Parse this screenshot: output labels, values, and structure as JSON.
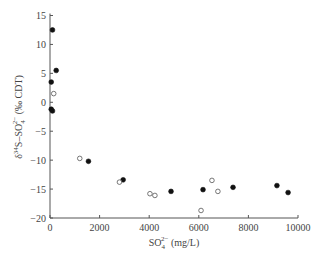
{
  "chart_data": {
    "type": "scatter",
    "title": "",
    "xlabel": "SO4^2- (mg/L)",
    "ylabel": "δ34S–SO4^2- (‰ CDT)",
    "xlim": [
      0,
      10000
    ],
    "ylim": [
      -20,
      15
    ],
    "xticks": [
      0,
      2000,
      4000,
      6000,
      8000,
      10000
    ],
    "yticks": [
      -20,
      -15,
      -10,
      -5,
      0,
      5,
      10,
      15
    ],
    "grid": false,
    "legend": null,
    "series": [
      {
        "name": "filled",
        "marker": "filled-circle",
        "color": "#111111",
        "points": [
          [
            100,
            12.5
          ],
          [
            250,
            5.5
          ],
          [
            50,
            3.5
          ],
          [
            50,
            -1.2
          ],
          [
            100,
            -1.5
          ],
          [
            1550,
            -10.2
          ],
          [
            2950,
            -13.4
          ],
          [
            4880,
            -15.4
          ],
          [
            6170,
            -15.1
          ],
          [
            7380,
            -14.7
          ],
          [
            9150,
            -14.4
          ],
          [
            9600,
            -15.6
          ]
        ]
      },
      {
        "name": "open",
        "marker": "open-circle",
        "color": "#555555",
        "points": [
          [
            150,
            1.5
          ],
          [
            1200,
            -9.7
          ],
          [
            2800,
            -13.8
          ],
          [
            4030,
            -15.8
          ],
          [
            4230,
            -16.1
          ],
          [
            6090,
            -18.7
          ],
          [
            6530,
            -13.5
          ],
          [
            6770,
            -15.4
          ]
        ]
      }
    ]
  },
  "labels": {
    "x_title_main": "SO",
    "x_title_sub": "4",
    "x_title_sup": "2−",
    "x_title_units": " (mg/L)",
    "y_title_delta": "δ",
    "y_title_sup34": "34",
    "y_title_s": "S–SO",
    "y_title_sub": "4",
    "y_title_sup": "2−",
    "y_title_units": " (‰ CDT)"
  }
}
